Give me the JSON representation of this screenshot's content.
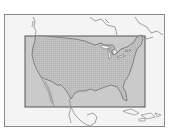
{
  "map": {
    "region": "Contiguous United States",
    "highlight_box": {
      "color": "#c4c4c4",
      "border": "#555555"
    },
    "land_fill": "#f4f4f4",
    "us_fill": "#bdbdbd",
    "line_color": "#7a7a7a"
  }
}
